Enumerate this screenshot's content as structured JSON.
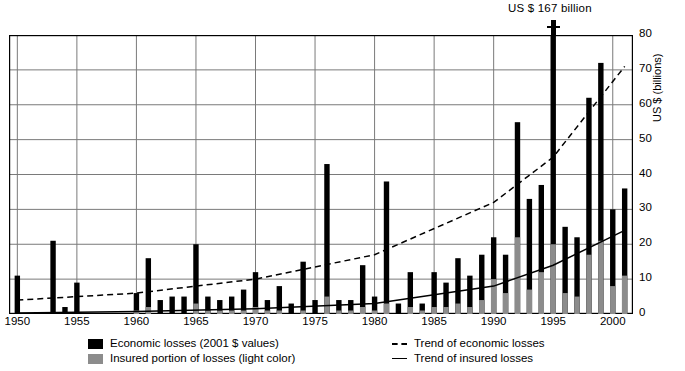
{
  "annotation": {
    "peak_label": "US $ 167 billion"
  },
  "axes": {
    "ylabel": "US $ (billions)",
    "yticks": [
      0,
      10,
      20,
      30,
      40,
      50,
      60,
      70,
      80
    ],
    "xticks": [
      1950,
      1955,
      1960,
      1965,
      1970,
      1975,
      1980,
      1985,
      1990,
      1995,
      2000
    ]
  },
  "legend": {
    "economic_losses": "Economic losses (2001 $ values)",
    "insured_portion": "Insured portion of losses (light color)",
    "trend_economic": "Trend of economic losses",
    "trend_insured": "Trend of insured losses"
  },
  "colors": {
    "economic": "#000000",
    "insured": "#8c8c8c",
    "grid": "#7a7a7a",
    "axis": "#000000"
  },
  "chart_data": {
    "type": "bar",
    "title": "",
    "xlabel": "",
    "ylabel": "US $ (billions)",
    "ylim": [
      0,
      80
    ],
    "xlim": [
      1949.3,
      2001.7
    ],
    "grid": true,
    "legend_position": "below",
    "note": "Great natural catastrophes 1950-2001. Bars truncated at 80; 1995 bar actual value 167 (annotated).",
    "categories": [
      1950,
      1951,
      1952,
      1953,
      1954,
      1955,
      1956,
      1957,
      1958,
      1959,
      1960,
      1961,
      1962,
      1963,
      1964,
      1965,
      1966,
      1967,
      1968,
      1969,
      1970,
      1971,
      1972,
      1973,
      1974,
      1975,
      1976,
      1977,
      1978,
      1979,
      1980,
      1981,
      1982,
      1983,
      1984,
      1985,
      1986,
      1987,
      1988,
      1989,
      1990,
      1991,
      1992,
      1993,
      1994,
      1995,
      1996,
      1997,
      1998,
      1999,
      2000,
      2001
    ],
    "series": [
      {
        "name": "Economic losses (2001 $ values)",
        "values": [
          11,
          0,
          0,
          21,
          2,
          9,
          0,
          0,
          0,
          0,
          6,
          16,
          4,
          5,
          5,
          20,
          5,
          4,
          5,
          7,
          12,
          4,
          8,
          3,
          15,
          4,
          43,
          4,
          4,
          14,
          5,
          38,
          3,
          12,
          3,
          12,
          9,
          16,
          11,
          17,
          22,
          17,
          55,
          33,
          37,
          167,
          25,
          22,
          62,
          72,
          30,
          36
        ]
      },
      {
        "name": "Insured portion of losses (light color)",
        "values": [
          0,
          0,
          0,
          0,
          0,
          0,
          0,
          0,
          0,
          0,
          1,
          2,
          0,
          0,
          0,
          3,
          1,
          1,
          1,
          1,
          2,
          1,
          1,
          0,
          1,
          0,
          5,
          1,
          1,
          2,
          1,
          3,
          0,
          2,
          1,
          2,
          2,
          3,
          2,
          4,
          10,
          6,
          22,
          7,
          12,
          20,
          6,
          5,
          17,
          21,
          8,
          11
        ]
      }
    ],
    "trend_economic": {
      "label": "Trend of economic losses",
      "style": "dashed",
      "points": [
        [
          1950,
          4
        ],
        [
          1960,
          6
        ],
        [
          1970,
          10
        ],
        [
          1980,
          17
        ],
        [
          1990,
          32
        ],
        [
          1995,
          45
        ],
        [
          2001,
          71
        ]
      ]
    },
    "trend_insured": {
      "label": "Trend of insured losses",
      "style": "solid",
      "points": [
        [
          1950,
          0.3
        ],
        [
          1960,
          0.7
        ],
        [
          1970,
          1.5
        ],
        [
          1980,
          3
        ],
        [
          1990,
          8
        ],
        [
          1995,
          14
        ],
        [
          2001,
          24
        ]
      ]
    }
  }
}
